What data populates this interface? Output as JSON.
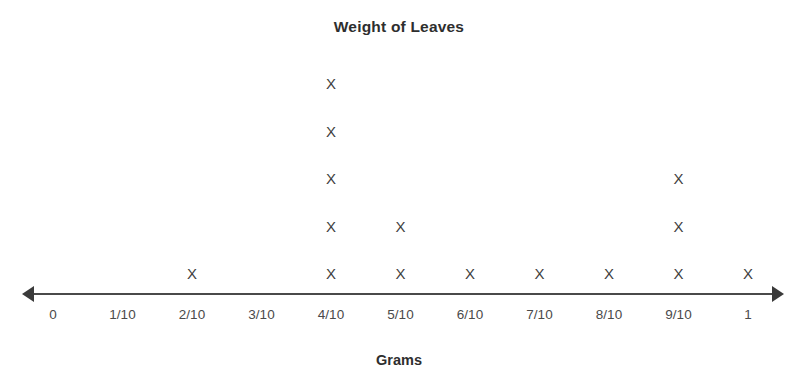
{
  "chart_data": {
    "type": "scatter",
    "plot_style": "dot-plot",
    "title": "Weight of Leaves",
    "xlabel": "Grams",
    "ylabel": "",
    "grid": false,
    "legend": null,
    "mark_glyph": "X",
    "categories": [
      "0",
      "1/10",
      "2/10",
      "3/10",
      "4/10",
      "5/10",
      "6/10",
      "7/10",
      "8/10",
      "9/10",
      "1"
    ],
    "x": [
      0,
      0.1,
      0.2,
      0.3,
      0.4,
      0.5,
      0.6,
      0.7,
      0.8,
      0.9,
      1
    ],
    "values": [
      0,
      0,
      1,
      0,
      5,
      2,
      1,
      1,
      1,
      3,
      1
    ],
    "xlim": [
      0,
      1
    ],
    "ylim": [
      0,
      5
    ],
    "total_marks": 15,
    "axis_style": "double-arrow-number-line"
  },
  "header": {
    "title": "Weight of Leaves"
  },
  "axis": {
    "caption": "Grams",
    "left_arrow_icon": "arrow-left-icon",
    "right_arrow_icon": "arrow-right-icon",
    "ticks": [
      {
        "label": "0",
        "value": 0,
        "count": 0
      },
      {
        "label": "1/10",
        "value": 0.1,
        "count": 0
      },
      {
        "label": "2/10",
        "value": 0.2,
        "count": 1
      },
      {
        "label": "3/10",
        "value": 0.3,
        "count": 0
      },
      {
        "label": "4/10",
        "value": 0.4,
        "count": 5
      },
      {
        "label": "5/10",
        "value": 0.5,
        "count": 2
      },
      {
        "label": "6/10",
        "value": 0.6,
        "count": 1
      },
      {
        "label": "7/10",
        "value": 0.7,
        "count": 1
      },
      {
        "label": "8/10",
        "value": 0.8,
        "count": 1
      },
      {
        "label": "9/10",
        "value": 0.9,
        "count": 3
      },
      {
        "label": "1",
        "value": 1,
        "count": 1
      }
    ]
  },
  "marks": {
    "glyph": "X"
  },
  "colors": {
    "background": "#ffffff",
    "text": "#3b3b3b",
    "title": "#2e2e2e",
    "axis": "#4a4a4a",
    "mark": "#3f3f3f"
  },
  "layout": {
    "tick_start_x": 53,
    "tick_spacing_x": 69.5,
    "row_base_y": 266,
    "row_spacing_y": 47.5
  }
}
